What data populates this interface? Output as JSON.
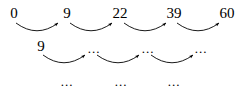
{
  "diagram": {
    "background_color": "#ffffff",
    "ink_color": "#000000",
    "rows": [
      {
        "name": "top-row",
        "labels": [
          {
            "text": "0",
            "x": 14,
            "y": 6
          },
          {
            "text": "9",
            "x": 67,
            "y": 6
          },
          {
            "text": "22",
            "x": 120,
            "y": 6
          },
          {
            "text": "39",
            "x": 174,
            "y": 6
          },
          {
            "text": "60",
            "x": 227,
            "y": 6
          }
        ],
        "arrows": [
          {
            "x1": 16,
            "x2": 58,
            "ybase": 23,
            "ydip": 33
          },
          {
            "x1": 70,
            "x2": 112,
            "ybase": 23,
            "ydip": 33
          },
          {
            "x1": 124,
            "x2": 166,
            "ybase": 23,
            "ydip": 33
          },
          {
            "x1": 177,
            "x2": 219,
            "ybase": 23,
            "ydip": 33
          }
        ]
      },
      {
        "name": "middle-row",
        "labels": [
          {
            "text": "9",
            "x": 41,
            "y": 39
          },
          {
            "text": "...",
            "x": 94,
            "y": 42
          },
          {
            "text": "...",
            "x": 148,
            "y": 42
          },
          {
            "text": "...",
            "x": 201,
            "y": 42
          }
        ],
        "arrows": [
          {
            "x1": 43,
            "x2": 85,
            "ybase": 55,
            "ydip": 65
          },
          {
            "x1": 97,
            "x2": 139,
            "ybase": 55,
            "ydip": 65
          },
          {
            "x1": 151,
            "x2": 193,
            "ybase": 55,
            "ydip": 65
          }
        ]
      },
      {
        "name": "bottom-row",
        "labels": [
          {
            "text": "...",
            "x": 67,
            "y": 75
          },
          {
            "text": "...",
            "x": 121,
            "y": 75
          },
          {
            "text": "...",
            "x": 174,
            "y": 75
          }
        ],
        "arrows": []
      }
    ]
  }
}
